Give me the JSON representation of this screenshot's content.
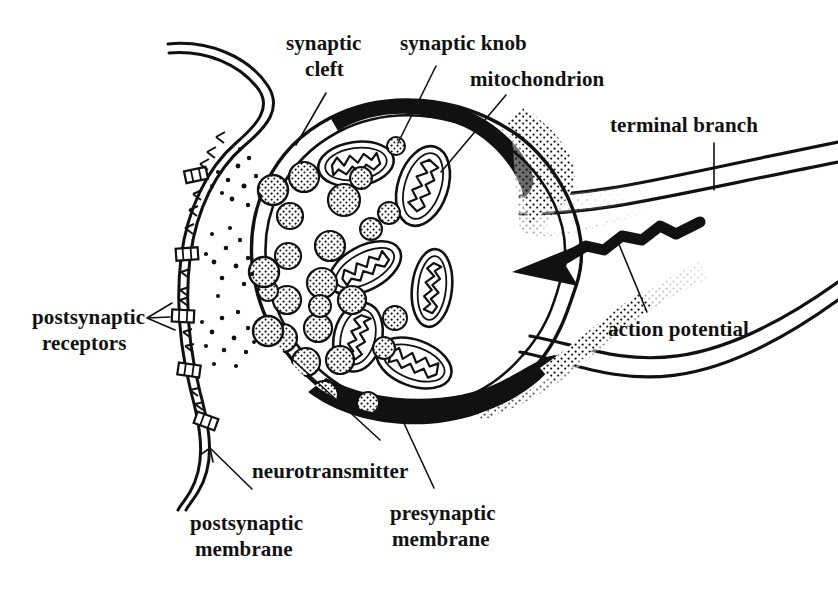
{
  "figure": {
    "background_color": "#ffffff",
    "ink_color": "#111111",
    "width": 838,
    "height": 603
  },
  "labels": {
    "synaptic_cleft": "synaptic\ncleft",
    "synaptic_cleft_line1": "synaptic",
    "synaptic_cleft_line2": "cleft",
    "synaptic_knob": "synaptic knob",
    "mitochondrion": "mitochondrion",
    "terminal_branch": "terminal branch",
    "action_potential": "action potential",
    "postsynaptic_receptors_line1": "postsynaptic",
    "postsynaptic_receptors_line2": "receptors",
    "neurotransmitter": "neurotransmitter",
    "postsynaptic_membrane_line1": "postsynaptic",
    "postsynaptic_membrane_line2": "membrane",
    "presynaptic_membrane_line1": "presynaptic",
    "presynaptic_membrane_line2": "membrane"
  },
  "structures": {
    "synaptic_knob": {
      "name": "synaptic knob",
      "shape": "bulb",
      "center": [
        405,
        258
      ],
      "radius_x": 158,
      "radius_y": 163
    },
    "terminal_branch": {
      "name": "terminal branch",
      "description": "axon branch entering knob from right"
    },
    "presynaptic_membrane": {
      "name": "presynaptic membrane",
      "rendering": "thick black crescent fading to stipple"
    },
    "postsynaptic_membrane": {
      "name": "postsynaptic membrane",
      "rendering": "double wavy line on left"
    },
    "synaptic_cleft": {
      "name": "synaptic cleft",
      "rendering": "gap between presynaptic and postsynaptic membranes"
    },
    "action_potential": {
      "name": "action potential",
      "rendering": "thick zigzag arrow pointing left toward knob"
    }
  },
  "counts": {
    "vesicles_free": 26,
    "vesicles_fusing": 3,
    "mitochondria": 7,
    "receptors": 5
  },
  "vesicles": [
    [
      304,
      177,
      15
    ],
    [
      344,
      200,
      16
    ],
    [
      290,
      216,
      13
    ],
    [
      330,
      246,
      15
    ],
    [
      288,
      256,
      13
    ],
    [
      322,
      283,
      15
    ],
    [
      287,
      300,
      14
    ],
    [
      352,
      268,
      14
    ],
    [
      361,
      178,
      11
    ],
    [
      381,
      215,
      11
    ],
    [
      283,
      338,
      14
    ],
    [
      318,
      328,
      14
    ],
    [
      306,
      362,
      14
    ],
    [
      340,
      355,
      14
    ],
    [
      288,
      382,
      13
    ],
    [
      324,
      395,
      14
    ],
    [
      352,
      318,
      12
    ],
    [
      371,
      289,
      11
    ],
    [
      304,
      413,
      12
    ],
    [
      341,
      424,
      11
    ],
    [
      365,
      402,
      11
    ],
    [
      384,
      348,
      11
    ],
    [
      263,
      372,
      10
    ],
    [
      266,
      291,
      10
    ],
    [
      398,
      310,
      9
    ],
    [
      378,
      380,
      10
    ]
  ],
  "fusing_vesicles": [
    [
      273,
      190,
      15
    ],
    [
      264,
      272,
      15
    ],
    [
      268,
      331,
      15
    ]
  ],
  "mitochondria": [
    {
      "cx": 356,
      "cy": 164,
      "rx": 38,
      "ry": 22,
      "rot": -8
    },
    {
      "cx": 423,
      "cy": 186,
      "rx": 26,
      "ry": 40,
      "rot": 18
    },
    {
      "cx": 365,
      "cy": 268,
      "rx": 38,
      "ry": 22,
      "rot": -28
    },
    {
      "cx": 432,
      "cy": 288,
      "rx": 20,
      "ry": 38,
      "rot": 6
    },
    {
      "cx": 358,
      "cy": 337,
      "rx": 24,
      "ry": 34,
      "rot": 14
    },
    {
      "cx": 414,
      "cy": 363,
      "rx": 38,
      "ry": 22,
      "rot": 20
    }
  ],
  "receptors": [
    [
      196,
      175
    ],
    [
      187,
      254
    ],
    [
      183,
      316
    ],
    [
      189,
      370
    ],
    [
      206,
      421
    ]
  ]
}
